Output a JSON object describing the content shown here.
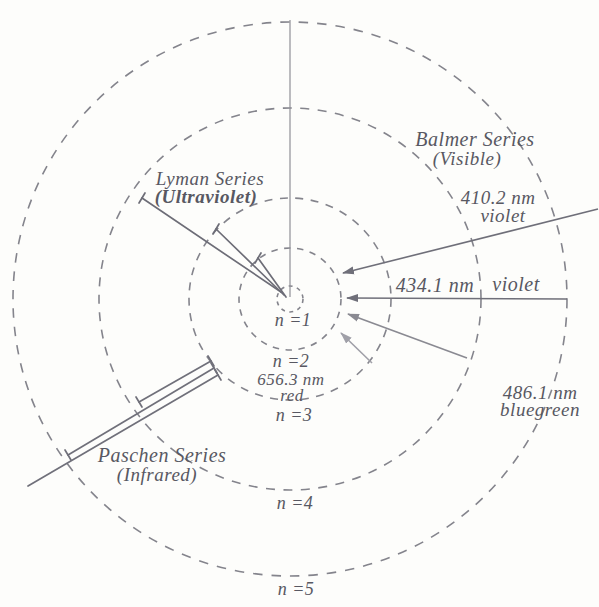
{
  "orbits": [
    {
      "n": 1,
      "label": "n =1",
      "radius_px": 13
    },
    {
      "n": 2,
      "label": "n =2",
      "radius_px": 51
    },
    {
      "n": 3,
      "label": "n =3",
      "radius_px": 101
    },
    {
      "n": 4,
      "label": "n =4",
      "radius_px": 191
    },
    {
      "n": 5,
      "label": "n =5",
      "radius_px": 277
    }
  ],
  "series": {
    "lyman": {
      "name": "Lyman Series",
      "band": "(Ultraviolet)"
    },
    "balmer": {
      "name": "Balmer Series",
      "band": "(Visible)"
    },
    "paschen": {
      "name": "Paschen Series",
      "band": "(Infrared)"
    }
  },
  "balmer_lines": {
    "h_delta": {
      "wavelength": "410.2 nm",
      "color_name": "violet"
    },
    "h_gamma": {
      "wavelength": "434.1 nm",
      "color_name": "violet"
    },
    "h_beta": {
      "wavelength": "486.1 nm",
      "color_name": "bluegreen"
    },
    "h_alpha": {
      "wavelength": "656.3 nm",
      "color_name": "red"
    }
  },
  "colors": {
    "orbit_stroke": "#84848c",
    "line_dark": "#6f6f79",
    "line_mid": "#8a8a92",
    "line_light": "#a0a0a8",
    "text": "#585862",
    "background": "#fdfdfb"
  }
}
